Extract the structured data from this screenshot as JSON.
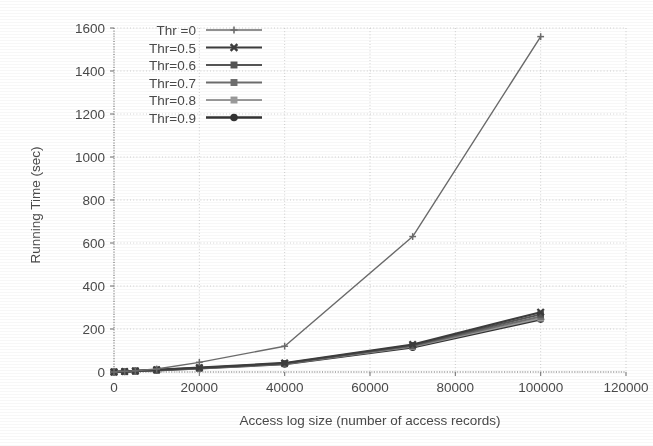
{
  "chart_data": {
    "type": "line",
    "title": "",
    "xlabel": "Access log size (number of access records)",
    "ylabel": "Running Time (sec)",
    "xlim": [
      0,
      120000
    ],
    "ylim": [
      0,
      1600
    ],
    "xticks": [
      0,
      20000,
      40000,
      60000,
      80000,
      100000,
      120000
    ],
    "xtick_labels": [
      "0",
      "20000",
      "40000",
      "60000",
      "80000",
      "100000",
      "120000"
    ],
    "yticks": [
      0,
      200,
      400,
      600,
      800,
      1000,
      1200,
      1400,
      1600
    ],
    "ytick_labels": [
      "0",
      "200",
      "400",
      "600",
      "800",
      "1000",
      "1200",
      "1400",
      "1600"
    ],
    "grid": true,
    "grid_style": "dotted",
    "legend_position": "upper left",
    "x": [
      0,
      2500,
      5000,
      10000,
      20000,
      40000,
      70000,
      100000
    ],
    "series": [
      {
        "name": "Thr =0",
        "marker": "plus",
        "color": "#6b6b6b",
        "linewidth": 1.4,
        "values": [
          0,
          3,
          6,
          14,
          45,
          120,
          630,
          1560
        ]
      },
      {
        "name": "Thr=0.5",
        "marker": "x",
        "color": "#3d3d3d",
        "linewidth": 2.2,
        "values": [
          0,
          2,
          5,
          10,
          20,
          42,
          128,
          278
        ]
      },
      {
        "name": "Thr=0.6",
        "marker": "square",
        "color": "#555555",
        "linewidth": 2.0,
        "values": [
          0,
          2,
          5,
          10,
          19,
          40,
          124,
          268
        ]
      },
      {
        "name": "Thr=0.7",
        "marker": "square",
        "color": "#6e6e6e",
        "linewidth": 2.0,
        "values": [
          0,
          2,
          4,
          9,
          18,
          39,
          121,
          258
        ]
      },
      {
        "name": "Thr=0.8",
        "marker": "square-light",
        "color": "#9a9a9a",
        "linewidth": 1.8,
        "values": [
          0,
          2,
          4,
          9,
          18,
          38,
          118,
          250
        ]
      },
      {
        "name": "Thr=0.9",
        "marker": "circle",
        "color": "#333333",
        "linewidth": 2.4,
        "values": [
          0,
          2,
          4,
          8,
          17,
          37,
          115,
          245
        ]
      }
    ]
  },
  "legend": {
    "entries": [
      {
        "label": "Thr =0"
      },
      {
        "label": "Thr=0.5"
      },
      {
        "label": "Thr=0.6"
      },
      {
        "label": "Thr=0.7"
      },
      {
        "label": "Thr=0.8"
      },
      {
        "label": "Thr=0.9"
      }
    ]
  },
  "colors": {
    "grid": "#cfcfcf",
    "axis": "#777777",
    "text": "#4a4a4a",
    "background": "#ffffff"
  }
}
